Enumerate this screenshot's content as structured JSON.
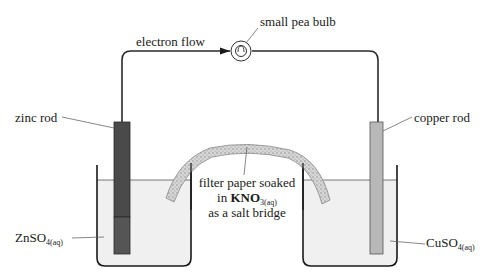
{
  "diagram": {
    "labels": {
      "electron_flow": "electron flow",
      "bulb": "small pea bulb",
      "zinc_rod": "zinc rod",
      "copper_rod": "copper rod",
      "salt_bridge_line1": "filter paper soaked",
      "salt_bridge_line2_prefix": "in ",
      "salt_bridge_formula": "KNO",
      "salt_bridge_formula_sub": "3(aq)",
      "salt_bridge_line3": "as a salt bridge",
      "left_solution": "ZnSO",
      "left_solution_sub": "4(aq)",
      "right_solution": "CuSO",
      "right_solution_sub": "4(aq)"
    },
    "colors": {
      "wire": "#2b2b2b",
      "zinc_rod": "#4a4a4a",
      "copper_rod": "#b8b8b8",
      "solution": "#f0f0f0",
      "beaker": "#1a1a1a",
      "salt_bridge": "#c8c8c8"
    }
  }
}
